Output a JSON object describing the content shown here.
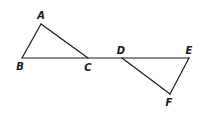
{
  "diagram": {
    "type": "geometry",
    "points": {
      "A": {
        "label": "A",
        "x": 41,
        "y": 24,
        "label_x": 41,
        "label_y": 19
      },
      "B": {
        "label": "B",
        "x": 22,
        "y": 58,
        "label_x": 20,
        "label_y": 70
      },
      "C": {
        "label": "C",
        "x": 88,
        "y": 58,
        "label_x": 88,
        "label_y": 71
      },
      "D": {
        "label": "D",
        "x": 122,
        "y": 58,
        "label_x": 121,
        "label_y": 54
      },
      "E": {
        "label": "E",
        "x": 189,
        "y": 58,
        "label_x": 189,
        "label_y": 54
      },
      "F": {
        "label": "F",
        "x": 170,
        "y": 94,
        "label_x": 169,
        "label_y": 106
      }
    },
    "segments": [
      {
        "from": "A",
        "to": "B"
      },
      {
        "from": "A",
        "to": "C"
      },
      {
        "from": "B",
        "to": "E"
      },
      {
        "from": "D",
        "to": "F"
      },
      {
        "from": "E",
        "to": "F"
      }
    ],
    "triangles": [
      "ABC",
      "DEF"
    ],
    "colors": {
      "stroke": "#1a1a1a",
      "background": "#ffffff"
    }
  }
}
